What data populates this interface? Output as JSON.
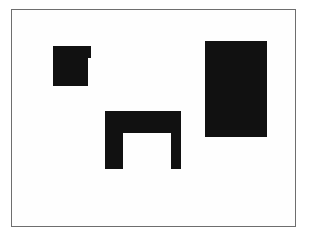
{
  "canvas": {
    "width": 305,
    "height": 233,
    "background": "#ffffff"
  },
  "frame": {
    "x": 11,
    "y": 9,
    "width": 285,
    "height": 218,
    "border_color": "#6e6e6e"
  },
  "shapes": [
    {
      "name": "notched-square",
      "color": "#111111",
      "parts": [
        {
          "x": 53,
          "y": 46,
          "width": 38,
          "height": 12
        },
        {
          "x": 53,
          "y": 58,
          "width": 35,
          "height": 28
        }
      ]
    },
    {
      "name": "arch",
      "color": "#111111",
      "parts": [
        {
          "x": 105,
          "y": 111,
          "width": 76,
          "height": 22
        },
        {
          "x": 105,
          "y": 133,
          "width": 18,
          "height": 36
        },
        {
          "x": 171,
          "y": 133,
          "width": 10,
          "height": 36
        }
      ]
    },
    {
      "name": "tall-rectangle",
      "color": "#111111",
      "parts": [
        {
          "x": 205,
          "y": 41,
          "width": 62,
          "height": 96
        }
      ]
    }
  ]
}
